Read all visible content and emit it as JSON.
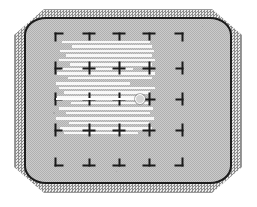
{
  "device": {
    "name": "CRT display test pattern",
    "screen_label": "crt-screen",
    "bezel_label": "monitor-bezel"
  },
  "colors": {
    "bezel_dither_dark": "#8e8e8e",
    "bezel_dither_light": "#e8e8e8",
    "screen_base": "#bdbdbd",
    "screen_outline": "#1c1c1c",
    "mark_color": "#1a1a1a",
    "streak_color": "#fdfdfd",
    "cursor_color": "#ffffff",
    "page_background": "#ffffff"
  },
  "pattern": {
    "type": "convergence-grid",
    "columns": 5,
    "rows": 5,
    "column_x": [
      33,
      63,
      93,
      123,
      153
    ],
    "row_y": [
      18,
      49,
      80,
      111,
      143
    ],
    "marks": [
      [
        {
          "kind": "corner-tl",
          "name": "mark-corner-top-left"
        },
        {
          "kind": "tee-down",
          "name": "mark-tee-down"
        },
        {
          "kind": "tee-down",
          "name": "mark-tee-down"
        },
        {
          "kind": "tee-down",
          "name": "mark-tee-down"
        },
        {
          "kind": "corner-tr",
          "name": "mark-corner-top-right"
        }
      ],
      [
        {
          "kind": "tee-right",
          "name": "mark-tee-right"
        },
        {
          "kind": "plus",
          "name": "mark-plus"
        },
        {
          "kind": "plus",
          "name": "mark-plus"
        },
        {
          "kind": "plus",
          "name": "mark-plus"
        },
        {
          "kind": "tee-left",
          "name": "mark-tee-left"
        }
      ],
      [
        {
          "kind": "tee-right",
          "name": "mark-tee-right"
        },
        {
          "kind": "plus",
          "name": "mark-plus"
        },
        {
          "kind": "plus",
          "name": "mark-plus"
        },
        {
          "kind": "plus",
          "name": "mark-plus"
        },
        {
          "kind": "tee-left",
          "name": "mark-tee-left"
        }
      ],
      [
        {
          "kind": "tee-right",
          "name": "mark-tee-right"
        },
        {
          "kind": "plus",
          "name": "mark-plus"
        },
        {
          "kind": "plus",
          "name": "mark-plus"
        },
        {
          "kind": "plus",
          "name": "mark-plus"
        },
        {
          "kind": "tee-left",
          "name": "mark-tee-left"
        }
      ],
      [
        {
          "kind": "corner-bl",
          "name": "mark-corner-bottom-left"
        },
        {
          "kind": "tee-up",
          "name": "mark-tee-up"
        },
        {
          "kind": "tee-up",
          "name": "mark-tee-up"
        },
        {
          "kind": "tee-up",
          "name": "mark-tee-up"
        },
        {
          "kind": "corner-br",
          "name": "mark-corner-bottom-right"
        }
      ]
    ]
  },
  "artifact": {
    "name": "white-streak-band",
    "description": "horizontal white scanline streaks over upper-left quadrant",
    "streaks": [
      {
        "x": 36,
        "y": 22,
        "w": 88,
        "h": 2
      },
      {
        "x": 46,
        "y": 26,
        "w": 80,
        "h": 3
      },
      {
        "x": 34,
        "y": 31,
        "w": 94,
        "h": 2
      },
      {
        "x": 40,
        "y": 35,
        "w": 86,
        "h": 3
      },
      {
        "x": 33,
        "y": 40,
        "w": 96,
        "h": 2
      },
      {
        "x": 44,
        "y": 44,
        "w": 82,
        "h": 3
      },
      {
        "x": 35,
        "y": 49,
        "w": 72,
        "h": 2
      },
      {
        "x": 31,
        "y": 53,
        "w": 98,
        "h": 3
      },
      {
        "x": 42,
        "y": 58,
        "w": 84,
        "h": 2
      },
      {
        "x": 30,
        "y": 63,
        "w": 74,
        "h": 3
      },
      {
        "x": 33,
        "y": 68,
        "w": 96,
        "h": 2
      },
      {
        "x": 38,
        "y": 72,
        "w": 86,
        "h": 3
      },
      {
        "x": 31,
        "y": 77,
        "w": 88,
        "h": 3
      },
      {
        "x": 45,
        "y": 83,
        "w": 78,
        "h": 2
      },
      {
        "x": 33,
        "y": 88,
        "w": 94,
        "h": 3
      },
      {
        "x": 40,
        "y": 93,
        "w": 84,
        "h": 2
      },
      {
        "x": 30,
        "y": 98,
        "w": 98,
        "h": 3
      },
      {
        "x": 43,
        "y": 103,
        "w": 80,
        "h": 2
      },
      {
        "x": 34,
        "y": 108,
        "w": 92,
        "h": 3
      },
      {
        "x": 38,
        "y": 113,
        "w": 74,
        "h": 2
      }
    ]
  },
  "cursor": {
    "name": "cursor-dot",
    "x": 114,
    "y": 80,
    "tail_x": 30,
    "tail_w": 82,
    "radius_px": 4
  },
  "specks": [
    {
      "x": 27,
      "y": 93,
      "w": 2,
      "h": 2
    },
    {
      "x": 90,
      "y": 152,
      "w": 1,
      "h": 1
    },
    {
      "x": 176,
      "y": 7,
      "w": 1,
      "h": 1
    }
  ]
}
